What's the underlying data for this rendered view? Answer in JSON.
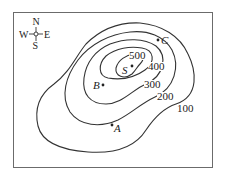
{
  "map": {
    "compass": {
      "north": "N",
      "south": "S",
      "east": "E",
      "west": "W"
    },
    "contours": [
      {
        "label": "100"
      },
      {
        "label": "200"
      },
      {
        "label": "300"
      },
      {
        "label": "400"
      },
      {
        "label": "500"
      }
    ],
    "points": {
      "summit": "S",
      "a": "A",
      "b": "B",
      "c": "C"
    },
    "colors": {
      "line": "#333333",
      "frame": "#6b6b6b",
      "background": "#ffffff"
    }
  }
}
